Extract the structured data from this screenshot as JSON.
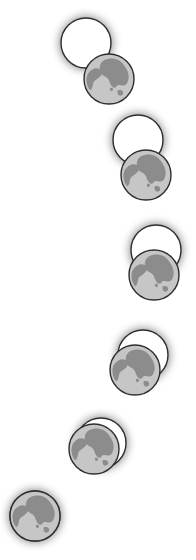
{
  "colors": {
    "background": "#ffffff",
    "sun_fill": "#ffffff",
    "outline": "#2e2e2e",
    "glow": "#808080",
    "moon_light": "#c6c6c6",
    "moon_dark": "#8c8c8c"
  },
  "phases": [
    {
      "name": "phase-1",
      "coverage": 0.2
    },
    {
      "name": "phase-2",
      "coverage": 0.35
    },
    {
      "name": "phase-3",
      "coverage": 0.55
    },
    {
      "name": "phase-4",
      "coverage": 0.7
    },
    {
      "name": "phase-5",
      "coverage": 0.85
    },
    {
      "name": "phase-6",
      "coverage": 1.0
    }
  ]
}
